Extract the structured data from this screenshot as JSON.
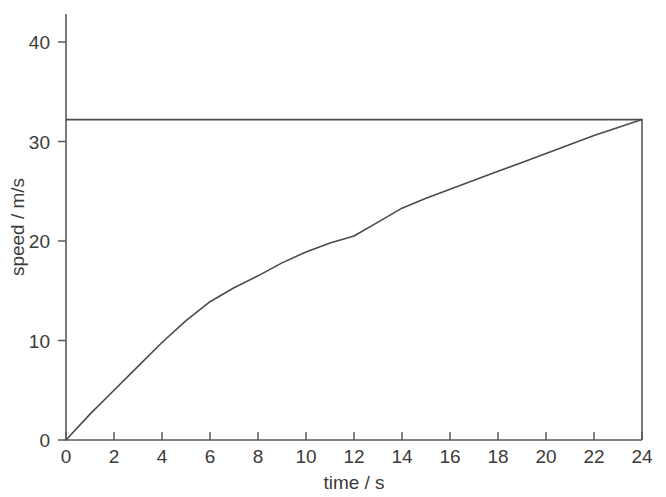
{
  "chart_data": {
    "type": "line",
    "title": "",
    "subtitle": "",
    "xlabel": "time / s",
    "ylabel": "speed / m/s",
    "xlim": [
      0,
      24
    ],
    "ylim": [
      0,
      42
    ],
    "xticks": [
      0,
      2,
      4,
      6,
      8,
      10,
      12,
      14,
      16,
      18,
      20,
      22,
      24
    ],
    "yticks": [
      0,
      10,
      20,
      30,
      40
    ],
    "xtick_labels": [
      "0",
      "2",
      "4",
      "6",
      "8",
      "10",
      "12",
      "14",
      "16",
      "18",
      "20",
      "22",
      "24"
    ],
    "ytick_labels": [
      "0",
      "10",
      "20",
      "30",
      "40"
    ],
    "grid": false,
    "legend": "none",
    "series": [
      {
        "name": "speed",
        "x": [
          0,
          1,
          2,
          3,
          4,
          5,
          6,
          7,
          8,
          9,
          10,
          11,
          12,
          13,
          14,
          15,
          16,
          17,
          18,
          19,
          20,
          21,
          22,
          23,
          24
        ],
        "values": [
          0.0,
          2.6,
          5.0,
          7.4,
          9.8,
          12.0,
          13.9,
          15.3,
          16.5,
          17.8,
          18.9,
          19.8,
          20.5,
          21.9,
          23.3,
          24.3,
          25.2,
          26.1,
          27.0,
          27.9,
          28.8,
          29.7,
          30.6,
          31.4,
          32.2
        ]
      },
      {
        "name": "terminal speed",
        "x": [
          0,
          24
        ],
        "values": [
          32.2,
          32.2
        ]
      },
      {
        "name": "end marker",
        "x": [
          24,
          24
        ],
        "values": [
          32.2,
          0.0
        ]
      }
    ],
    "annotations": []
  },
  "axes": {
    "x_axis_name": "time-axis",
    "y_axis_name": "speed-axis"
  }
}
